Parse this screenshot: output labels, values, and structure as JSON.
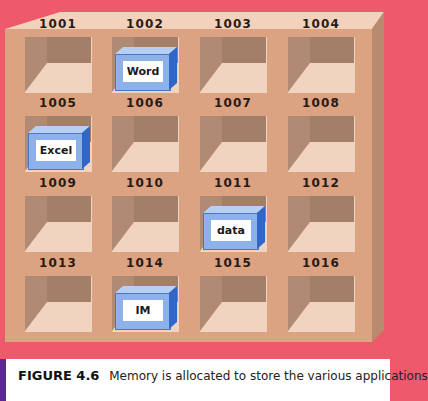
{
  "figure": {
    "title": "FIGURE 4.6",
    "caption": "Memory is allocated to store the various applications"
  },
  "colors": {
    "background": "#ee5a6c",
    "cabinet": "#dca383",
    "block_blue": "#8db2ea",
    "caption_bar": "#5b2a8a"
  },
  "cells": [
    {
      "address": "1001",
      "content": ""
    },
    {
      "address": "1002",
      "content": "Word"
    },
    {
      "address": "1003",
      "content": ""
    },
    {
      "address": "1004",
      "content": ""
    },
    {
      "address": "1005",
      "content": "Excel"
    },
    {
      "address": "1006",
      "content": ""
    },
    {
      "address": "1007",
      "content": ""
    },
    {
      "address": "1008",
      "content": ""
    },
    {
      "address": "1009",
      "content": ""
    },
    {
      "address": "1010",
      "content": ""
    },
    {
      "address": "1011",
      "content": "data"
    },
    {
      "address": "1012",
      "content": ""
    },
    {
      "address": "1013",
      "content": ""
    },
    {
      "address": "1014",
      "content": "IM"
    },
    {
      "address": "1015",
      "content": ""
    },
    {
      "address": "1016",
      "content": ""
    }
  ]
}
